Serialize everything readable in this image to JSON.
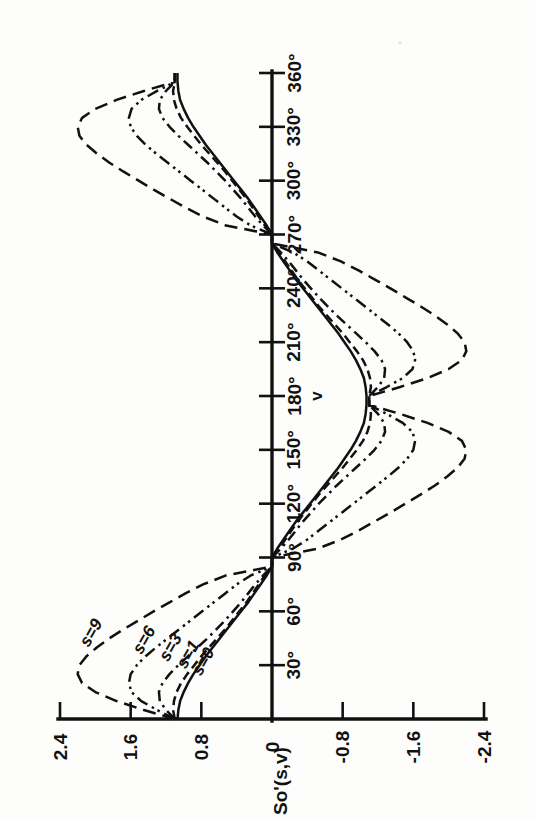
{
  "figure": {
    "name": "S0-prime-angular-distribution",
    "orientation": "rotated-90-ccw",
    "background_color": "#fdfdfb",
    "ink_color": "#111111"
  },
  "chart_data": {
    "type": "line",
    "title": "",
    "subtitle": "",
    "xlabel": "v",
    "ylabel": "So'(s,v)",
    "xlim": [
      0,
      360
    ],
    "ylim": [
      -2.4,
      2.4
    ],
    "grid": false,
    "legend_position": "inline-curve-labels",
    "x_tick_labels": [
      "30°",
      "60°",
      "90°",
      "120°",
      "150°",
      "180°",
      "210°",
      "240°",
      "270°",
      "300°",
      "330°",
      "360°"
    ],
    "x_tick_values": [
      30,
      60,
      90,
      120,
      150,
      180,
      210,
      240,
      270,
      300,
      330,
      360
    ],
    "y_tick_labels": [
      "2.4",
      "1.6",
      "0.8",
      "0",
      "-0.8",
      "-1.6",
      "-2.4"
    ],
    "y_tick_values": [
      2.4,
      1.6,
      0.8,
      0,
      -0.8,
      -1.6,
      -2.4
    ],
    "x": [
      0,
      5,
      10,
      15,
      20,
      25,
      30,
      35,
      40,
      45,
      50,
      55,
      60,
      65,
      70,
      75,
      80,
      85,
      90,
      95,
      100,
      105,
      110,
      115,
      120,
      125,
      130,
      135,
      140,
      145,
      150,
      155,
      160,
      165,
      170,
      175,
      180,
      185,
      190,
      195,
      200,
      205,
      210,
      215,
      220,
      225,
      230,
      235,
      240,
      245,
      250,
      255,
      260,
      265,
      270,
      275,
      280,
      285,
      290,
      295,
      300,
      305,
      310,
      315,
      320,
      325,
      330,
      335,
      340,
      345,
      350,
      355,
      360
    ],
    "series": [
      {
        "name": "s=0",
        "label": "s=0",
        "line_style": "solid",
        "peak_value": 1.07,
        "values": [
          1.07,
          1.06,
          1.04,
          1.0,
          0.95,
          0.89,
          0.82,
          0.75,
          0.67,
          0.59,
          0.51,
          0.43,
          0.35,
          0.27,
          0.2,
          0.13,
          0.06,
          0.0,
          0.0,
          -0.06,
          -0.13,
          -0.2,
          -0.27,
          -0.35,
          -0.43,
          -0.51,
          -0.59,
          -0.67,
          -0.75,
          -0.82,
          -0.89,
          -0.95,
          -1.0,
          -1.04,
          -1.06,
          -1.07,
          -1.07,
          -1.06,
          -1.04,
          -1.0,
          -0.95,
          -0.89,
          -0.82,
          -0.75,
          -0.67,
          -0.59,
          -0.51,
          -0.43,
          -0.35,
          -0.27,
          -0.2,
          -0.13,
          -0.06,
          0.0,
          0.0,
          0.06,
          0.13,
          0.2,
          0.27,
          0.35,
          0.43,
          0.51,
          0.59,
          0.67,
          0.75,
          0.82,
          0.89,
          0.95,
          1.0,
          1.04,
          1.06,
          1.07,
          1.07
        ]
      },
      {
        "name": "s=1",
        "label": "s=1",
        "line_style": "long-dash",
        "peak_value": 1.12,
        "values": [
          1.1,
          1.12,
          1.11,
          1.08,
          1.03,
          0.96,
          0.88,
          0.8,
          0.71,
          0.62,
          0.53,
          0.45,
          0.37,
          0.29,
          0.22,
          0.15,
          0.08,
          0.0,
          0.0,
          -0.08,
          -0.15,
          -0.22,
          -0.29,
          -0.37,
          -0.45,
          -0.53,
          -0.62,
          -0.71,
          -0.8,
          -0.88,
          -0.96,
          -1.03,
          -1.08,
          -1.11,
          -1.12,
          -1.1,
          -1.1,
          -1.12,
          -1.11,
          -1.08,
          -1.03,
          -0.96,
          -0.88,
          -0.8,
          -0.71,
          -0.62,
          -0.53,
          -0.45,
          -0.37,
          -0.29,
          -0.22,
          -0.15,
          -0.08,
          0.0,
          0.0,
          0.08,
          0.15,
          0.22,
          0.29,
          0.37,
          0.45,
          0.53,
          0.62,
          0.71,
          0.8,
          0.88,
          0.96,
          1.03,
          1.08,
          1.11,
          1.12,
          1.1,
          1.1
        ]
      },
      {
        "name": "s=3",
        "label": "s=3",
        "line_style": "dash-dot",
        "peak_value": 1.28,
        "values": [
          1.1,
          1.2,
          1.27,
          1.28,
          1.24,
          1.16,
          1.06,
          0.95,
          0.84,
          0.73,
          0.63,
          0.53,
          0.44,
          0.35,
          0.27,
          0.19,
          0.1,
          0.0,
          0.0,
          -0.1,
          -0.19,
          -0.27,
          -0.35,
          -0.44,
          -0.53,
          -0.63,
          -0.73,
          -0.84,
          -0.95,
          -1.06,
          -1.16,
          -1.24,
          -1.28,
          -1.27,
          -1.2,
          -1.1,
          -1.1,
          -1.2,
          -1.27,
          -1.28,
          -1.24,
          -1.16,
          -1.06,
          -0.95,
          -0.84,
          -0.73,
          -0.63,
          -0.53,
          -0.44,
          -0.35,
          -0.27,
          -0.19,
          -0.1,
          0.0,
          0.0,
          0.1,
          0.19,
          0.27,
          0.35,
          0.44,
          0.53,
          0.63,
          0.73,
          0.84,
          0.95,
          1.06,
          1.16,
          1.24,
          1.28,
          1.27,
          1.2,
          1.1,
          1.1
        ]
      },
      {
        "name": "s=6",
        "label": "s=6",
        "line_style": "dash-dot-dot",
        "peak_value": 1.62,
        "values": [
          1.1,
          1.3,
          1.48,
          1.59,
          1.62,
          1.6,
          1.53,
          1.43,
          1.31,
          1.18,
          1.05,
          0.92,
          0.79,
          0.66,
          0.53,
          0.4,
          0.24,
          0.0,
          0.0,
          -0.24,
          -0.4,
          -0.53,
          -0.66,
          -0.79,
          -0.92,
          -1.05,
          -1.18,
          -1.31,
          -1.43,
          -1.53,
          -1.6,
          -1.62,
          -1.59,
          -1.48,
          -1.3,
          -1.1,
          -1.1,
          -1.3,
          -1.48,
          -1.59,
          -1.62,
          -1.6,
          -1.53,
          -1.43,
          -1.31,
          -1.18,
          -1.05,
          -0.92,
          -0.79,
          -0.66,
          -0.53,
          -0.4,
          -0.24,
          0.0,
          0.0,
          0.24,
          0.4,
          0.53,
          0.66,
          0.79,
          0.92,
          1.05,
          1.18,
          1.31,
          1.43,
          1.53,
          1.6,
          1.62,
          1.59,
          1.48,
          1.3,
          1.1,
          1.1
        ]
      },
      {
        "name": "s=9",
        "label": "s=9",
        "line_style": "dash",
        "peak_value": 2.2,
        "values": [
          1.1,
          1.45,
          1.76,
          2.0,
          2.15,
          2.2,
          2.18,
          2.1,
          1.98,
          1.84,
          1.68,
          1.51,
          1.34,
          1.16,
          0.98,
          0.78,
          0.52,
          0.0,
          0.0,
          -0.52,
          -0.78,
          -0.98,
          -1.16,
          -1.34,
          -1.51,
          -1.68,
          -1.84,
          -1.98,
          -2.1,
          -2.18,
          -2.2,
          -2.15,
          -2.0,
          -1.76,
          -1.45,
          -1.1,
          -1.1,
          -1.45,
          -1.76,
          -2.0,
          -2.15,
          -2.2,
          -2.18,
          -2.1,
          -1.98,
          -1.84,
          -1.68,
          -1.51,
          -1.34,
          -1.16,
          -0.98,
          -0.78,
          -0.52,
          0.0,
          0.0,
          0.52,
          0.78,
          0.98,
          1.16,
          1.34,
          1.51,
          1.68,
          1.84,
          1.98,
          2.1,
          2.18,
          2.2,
          2.15,
          2.0,
          1.76,
          1.45,
          1.1,
          1.1
        ]
      }
    ],
    "annotations": [
      {
        "text": "s=9",
        "x": 48,
        "y": 2.05
      },
      {
        "text": "s=6",
        "x": 44,
        "y": 1.45
      },
      {
        "text": "s=3",
        "x": 40,
        "y": 1.15
      },
      {
        "text": "s=1",
        "x": 36,
        "y": 0.95
      },
      {
        "text": "s=0",
        "x": 32,
        "y": 0.78
      }
    ]
  }
}
